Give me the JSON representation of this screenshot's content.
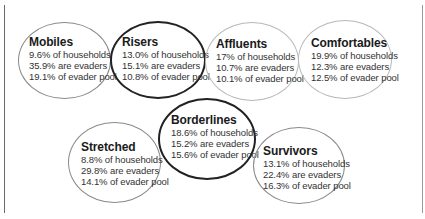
{
  "segments": [
    {
      "name": "Mobiles",
      "households": "9.6% of households",
      "evaders": "35.9% are evaders",
      "pool": "19.1% of evader pool",
      "emphasis": "medium"
    },
    {
      "name": "Risers",
      "households": "13.0% of households",
      "evaders": "15.1% are evaders",
      "pool": "10.8% of evader pool",
      "emphasis": "dark"
    },
    {
      "name": "Affluents",
      "households": "17% of households",
      "evaders": "10.7% are evaders",
      "pool": "10.1% of evader pool",
      "emphasis": "light"
    },
    {
      "name": "Comfortables",
      "households": "19.9% of households",
      "evaders": "12.3% are evaders",
      "pool": "12.5% of evader pool",
      "emphasis": "light"
    },
    {
      "name": "Borderlines",
      "households": "18.6% of households",
      "evaders": "15.2% are evaders",
      "pool": "15.6% of evader pool",
      "emphasis": "dark"
    },
    {
      "name": "Stretched",
      "households": "8.8% of households",
      "evaders": "29.8% are evaders",
      "pool": "14.1% of evader pool",
      "emphasis": "medium"
    },
    {
      "name": "Survivors",
      "households": "13.1% of households",
      "evaders": "22.4% are evaders",
      "pool": "16.3% of evader pool",
      "emphasis": "medium"
    }
  ]
}
